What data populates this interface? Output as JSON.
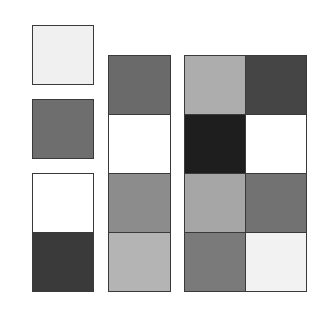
{
  "diagram": {
    "border_color": "#3a3a3a",
    "groups": [
      {
        "id": "sq1",
        "cols": 1,
        "rows": 1,
        "cells": [
          "#f0f0f0"
        ]
      },
      {
        "id": "sq2",
        "cols": 1,
        "rows": 1,
        "cells": [
          "#6e6e6e"
        ]
      },
      {
        "id": "col1",
        "cols": 1,
        "rows": 2,
        "cells": [
          "#ffffff",
          "#3a3a3a"
        ]
      },
      {
        "id": "col2",
        "cols": 1,
        "rows": 4,
        "cells": [
          "#6a6a6a",
          "#ffffff",
          "#8c8c8c",
          "#b4b4b4"
        ]
      },
      {
        "id": "grid3",
        "cols": 2,
        "rows": 4,
        "cells": [
          "#adadad",
          "#454545",
          "#1e1e1e",
          "#ffffff",
          "#a6a6a6",
          "#727272",
          "#7a7a7a",
          "#f2f2f2"
        ]
      }
    ]
  }
}
